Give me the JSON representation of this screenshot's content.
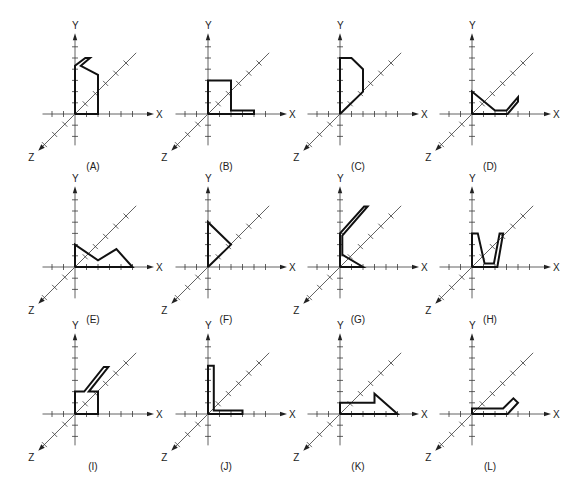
{
  "figure": {
    "axis_labels": {
      "x": "X",
      "y": "Y",
      "z": "Z"
    },
    "panels": [
      {
        "id": "A",
        "caption": "(A)",
        "shape": [
          [
            0,
            0
          ],
          [
            0,
            4.3
          ],
          [
            0.9,
            5
          ],
          [
            1.3,
            5
          ],
          [
            0.5,
            4.3
          ],
          [
            2,
            3.5
          ],
          [
            2,
            0
          ],
          [
            0,
            0
          ]
        ]
      },
      {
        "id": "B",
        "caption": "(B)",
        "shape": [
          [
            0,
            0
          ],
          [
            0,
            3
          ],
          [
            2,
            3
          ],
          [
            2,
            0.3
          ],
          [
            4,
            0.3
          ],
          [
            4,
            0
          ],
          [
            0,
            0
          ]
        ]
      },
      {
        "id": "C",
        "caption": "(C)",
        "shape": [
          [
            0,
            0
          ],
          [
            0,
            5
          ],
          [
            1,
            5
          ],
          [
            2,
            4
          ],
          [
            2,
            2
          ],
          [
            0,
            0
          ]
        ]
      },
      {
        "id": "D",
        "caption": "(D)",
        "shape": [
          [
            0,
            0
          ],
          [
            0,
            2
          ],
          [
            2,
            0.3
          ],
          [
            3,
            0.3
          ],
          [
            4,
            1.5
          ],
          [
            4,
            1.1
          ],
          [
            3.1,
            0
          ],
          [
            0,
            0
          ]
        ]
      },
      {
        "id": "E",
        "caption": "(E)",
        "shape": [
          [
            0,
            0
          ],
          [
            0,
            2
          ],
          [
            2,
            0.6
          ],
          [
            3.6,
            1.6
          ],
          [
            5,
            0
          ],
          [
            0,
            0
          ]
        ]
      },
      {
        "id": "F",
        "caption": "(F)",
        "shape": [
          [
            0,
            0
          ],
          [
            0,
            4
          ],
          [
            2,
            2
          ],
          [
            0,
            0
          ]
        ]
      },
      {
        "id": "G",
        "caption": "(G)",
        "shape": [
          [
            0,
            0
          ],
          [
            0,
            3
          ],
          [
            2.1,
            5.4
          ],
          [
            2.4,
            5.4
          ],
          [
            0.2,
            2.8
          ],
          [
            0.2,
            1.1
          ],
          [
            2,
            0
          ],
          [
            0,
            0
          ]
        ]
      },
      {
        "id": "H",
        "caption": "(H)",
        "shape": [
          [
            0,
            0
          ],
          [
            0,
            3
          ],
          [
            0.5,
            3
          ],
          [
            1.1,
            0.3
          ],
          [
            1.9,
            0.3
          ],
          [
            2.4,
            3
          ],
          [
            2.7,
            3
          ],
          [
            2.2,
            0
          ],
          [
            0,
            0
          ]
        ]
      },
      {
        "id": "I",
        "caption": "(I)",
        "shape": [
          [
            0,
            0
          ],
          [
            0,
            2
          ],
          [
            0.8,
            2
          ],
          [
            2.5,
            4.2
          ],
          [
            2.9,
            4.2
          ],
          [
            1.2,
            2
          ],
          [
            2,
            2
          ],
          [
            2,
            0
          ],
          [
            0,
            0
          ]
        ]
      },
      {
        "id": "J",
        "caption": "(J)",
        "shape": [
          [
            0,
            0
          ],
          [
            0,
            4.3
          ],
          [
            0.5,
            4.3
          ],
          [
            0.5,
            0.3
          ],
          [
            3,
            0.3
          ],
          [
            3,
            0
          ],
          [
            0,
            0
          ]
        ]
      },
      {
        "id": "K",
        "caption": "(K)",
        "shape": [
          [
            0,
            0
          ],
          [
            0,
            1
          ],
          [
            3,
            1
          ],
          [
            3,
            1.8
          ],
          [
            5,
            0
          ],
          [
            0,
            0
          ]
        ]
      },
      {
        "id": "L",
        "caption": "(L)",
        "shape": [
          [
            0,
            0
          ],
          [
            0,
            0.5
          ],
          [
            2.7,
            0.5
          ],
          [
            3.6,
            1.4
          ],
          [
            4,
            1
          ],
          [
            3.1,
            0
          ],
          [
            0,
            0
          ]
        ]
      }
    ]
  }
}
